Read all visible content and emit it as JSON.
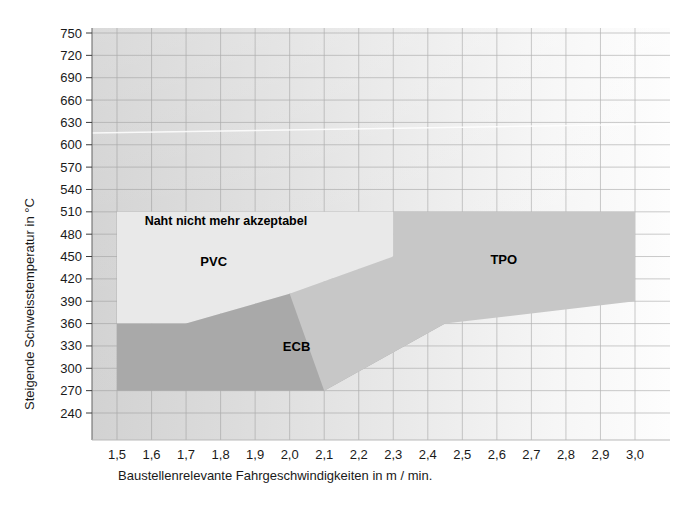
{
  "chart_data": {
    "type": "area",
    "title": "",
    "xlabel": "Baustellenrelevante Fahrgeschwindigkeiten in m / min.",
    "ylabel": "Steigende Schweisstemperatur in °C",
    "xlim": [
      1.5,
      3.0
    ],
    "ylim": [
      240,
      750
    ],
    "grid": true,
    "legend_position": "inline-annotations",
    "x_ticks": [
      "1,5",
      "1,6",
      "1,7",
      "1,8",
      "1,9",
      "2,0",
      "2,1",
      "2,2",
      "2,3",
      "2,4",
      "2,5",
      "2,6",
      "2,7",
      "2,8",
      "2,9",
      "3,0"
    ],
    "x_tick_values": [
      1.5,
      1.6,
      1.7,
      1.8,
      1.9,
      2.0,
      2.1,
      2.2,
      2.3,
      2.4,
      2.5,
      2.6,
      2.7,
      2.8,
      2.9,
      3.0
    ],
    "y_ticks": [
      "240",
      "270",
      "300",
      "330",
      "360",
      "390",
      "420",
      "450",
      "480",
      "510",
      "540",
      "570",
      "600",
      "630",
      "660",
      "690",
      "720",
      "750"
    ],
    "y_tick_values": [
      240,
      270,
      300,
      330,
      360,
      390,
      420,
      450,
      480,
      510,
      540,
      570,
      600,
      630,
      660,
      690,
      720,
      750
    ],
    "annotations": [
      {
        "text": "Naht nicht mehr akzeptabel",
        "x": 1.58,
        "y": 492
      },
      {
        "text": "PVC",
        "x": 1.78,
        "y": 437
      },
      {
        "text": "ECB",
        "x": 2.02,
        "y": 323
      },
      {
        "text": "TPO",
        "x": 2.62,
        "y": 440
      }
    ],
    "series": [
      {
        "name": "PVC",
        "color": "#e9e9e9",
        "upper_bound": [
          {
            "x": 1.5,
            "y": 510
          },
          {
            "x": 2.3,
            "y": 510
          }
        ],
        "lower_bound": [
          {
            "x": 1.5,
            "y": 360
          },
          {
            "x": 1.7,
            "y": 360
          },
          {
            "x": 2.0,
            "y": 400
          },
          {
            "x": 2.3,
            "y": 450
          }
        ],
        "polygon": [
          [
            1.5,
            510
          ],
          [
            2.3,
            510
          ],
          [
            2.3,
            450
          ],
          [
            2.0,
            400
          ],
          [
            1.7,
            360
          ],
          [
            1.5,
            360
          ]
        ]
      },
      {
        "name": "ECB",
        "color": "#a9a9a9",
        "upper_bound": [
          {
            "x": 1.5,
            "y": 360
          },
          {
            "x": 1.7,
            "y": 360
          },
          {
            "x": 2.0,
            "y": 400
          },
          {
            "x": 2.45,
            "y": 400
          }
        ],
        "lower_bound": [
          {
            "x": 1.5,
            "y": 270
          },
          {
            "x": 2.1,
            "y": 270
          },
          {
            "x": 2.45,
            "y": 360
          }
        ],
        "polygon": [
          [
            1.5,
            360
          ],
          [
            1.7,
            360
          ],
          [
            2.0,
            400
          ],
          [
            2.45,
            400
          ],
          [
            2.45,
            360
          ],
          [
            2.1,
            270
          ],
          [
            1.5,
            270
          ]
        ]
      },
      {
        "name": "TPO",
        "color": "#c7c7c7",
        "upper_bound": [
          {
            "x": 2.0,
            "y": 400
          },
          {
            "x": 2.3,
            "y": 450
          },
          {
            "x": 2.3,
            "y": 510
          },
          {
            "x": 3.0,
            "y": 510
          }
        ],
        "lower_bound": [
          {
            "x": 2.0,
            "y": 400
          },
          {
            "x": 2.1,
            "y": 270
          },
          {
            "x": 2.45,
            "y": 360
          },
          {
            "x": 3.0,
            "y": 390
          }
        ],
        "polygon": [
          [
            2.0,
            400
          ],
          [
            2.3,
            450
          ],
          [
            2.3,
            510
          ],
          [
            3.0,
            510
          ],
          [
            3.0,
            390
          ],
          [
            2.45,
            360
          ],
          [
            2.1,
            270
          ]
        ]
      }
    ]
  },
  "figure": {
    "plot_background_color": "#d9d9d9",
    "grid_color": "#9a9a9a",
    "axis_color": "#7d7d7d",
    "page_background": "#ffffff"
  }
}
